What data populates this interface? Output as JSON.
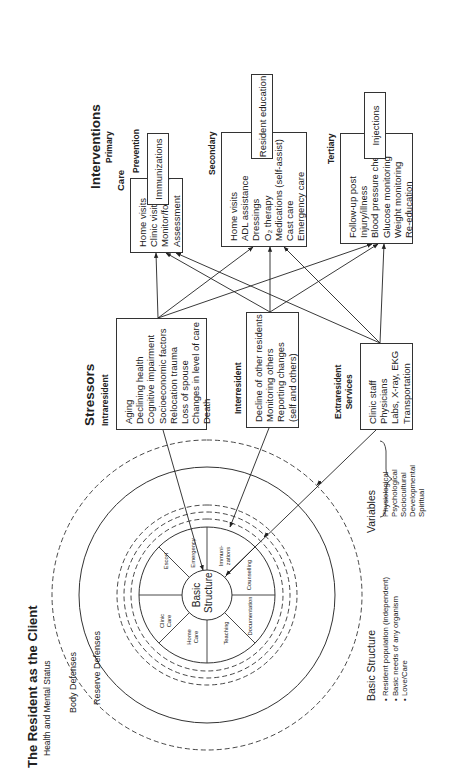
{
  "title": "The Resident as the Client",
  "subtitle": "Health and Mental Status",
  "rings": {
    "body_defenses": "Body Defenses",
    "reserve_defenses": "Reserve Defenses"
  },
  "basic_structure": {
    "center_label_1": "Basic",
    "center_label_2": "Structure",
    "segments": [
      "Escort",
      "Emergency",
      "Immuni-",
      "zations",
      "Counselling",
      "Documentation",
      "Teaching",
      "Home",
      "Care",
      "Clinic",
      "Care"
    ]
  },
  "stressors": {
    "heading": "Stressors",
    "intraresident": {
      "label": "Intraresident",
      "items": [
        "Aging",
        "Declining health",
        "Cognitive impairment",
        "Socioeconomic factors",
        "Relocation trauma",
        "Loss of spouse",
        "Changes in level of care",
        "Death"
      ]
    },
    "interresident": {
      "label": "Interresident",
      "items": [
        "Decline of other residents",
        "Monitoring others",
        "Reporting changes",
        "(self and others)"
      ]
    },
    "extraresident": {
      "label_1": "Extraresident",
      "label_2": "Services",
      "items": [
        "Clinic staff",
        "Physicians",
        "Labs, X-ray, EKG",
        "Transportation"
      ]
    }
  },
  "interventions": {
    "heading": "Interventions",
    "primary": "Primary",
    "care": {
      "label": "Care",
      "items": [
        "Home visits",
        "Clinic visits",
        "Monitor/follow-up",
        "Assessment"
      ]
    },
    "prevention": {
      "label": "Prevention",
      "box": "Immunizations"
    },
    "secondary": {
      "label": "Secondary",
      "items": [
        "Home visits",
        "ADL assistance",
        "Dressings",
        "O₂ therapy",
        "Medications (self-assist)",
        "Cast care",
        "Emergency care"
      ],
      "box": "Resident education"
    },
    "tertiary": {
      "label": "Tertiary",
      "items": [
        "Follow-up post",
        "Injury/illness",
        "Blood pressure checks",
        "Glucose monitoring",
        "Weight monitoring",
        "Re-education"
      ],
      "box": "Injections"
    }
  },
  "legend": {
    "basic_structure": {
      "heading": "Basic Structure",
      "items": [
        "• Resident population (independent)",
        "• Basic needs of any organism",
        "• Love/Care"
      ]
    },
    "variables": {
      "heading": "Variables",
      "items": [
        "Physiological",
        "Psychological",
        "Sociocultural",
        "Developmental",
        "Spiritual"
      ]
    }
  }
}
